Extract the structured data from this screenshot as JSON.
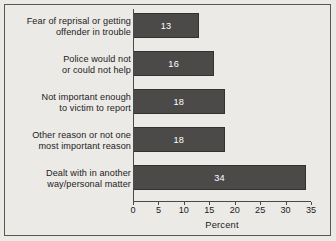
{
  "chart_data": {
    "type": "bar",
    "orientation": "horizontal",
    "title": "",
    "xlabel": "Percent",
    "ylabel": "",
    "xlim": [
      0,
      35
    ],
    "xticks": [
      0,
      5,
      10,
      15,
      20,
      25,
      30,
      35
    ],
    "grid": false,
    "legend": null,
    "categories": [
      "Fear of reprisal or getting\noffender in trouble",
      "Police would not\nor could not help",
      "Not important enough\nto victim to report",
      "Other reason or not one\nmost important reason",
      "Dealt with in another\nway/personal matter"
    ],
    "category_lines": [
      [
        "Fear of reprisal or getting",
        "offender in trouble"
      ],
      [
        "Police would not",
        "or could not help"
      ],
      [
        "Not important enough",
        "to victim to report"
      ],
      [
        "Other reason or not one",
        "most important reason"
      ],
      [
        "Dealt with in another",
        "way/personal matter"
      ]
    ],
    "values": [
      13,
      16,
      18,
      18,
      34
    ],
    "value_labels": [
      "13",
      "16",
      "18",
      "18",
      "34"
    ],
    "colors": {
      "bar_fill": "#4b4a49",
      "bar_stroke": "#333230",
      "value_text": "#ffffff",
      "axis": "#4a4945",
      "text": "#23211d",
      "background": "#eceae6",
      "frame": "#58564f"
    }
  }
}
